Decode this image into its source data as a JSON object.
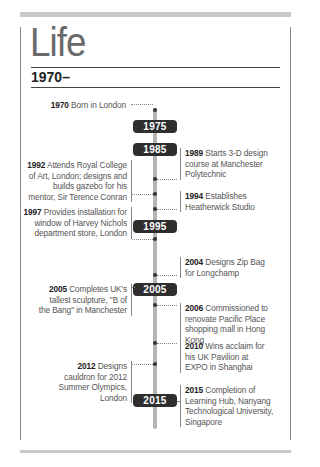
{
  "page": {
    "title": "Life",
    "era": "1970–"
  },
  "colors": {
    "pill_bg": "#2e2e2e",
    "timeline_line": "#b4b4b4",
    "border": "#888888",
    "top_bar": "#c9c9c9"
  },
  "timeline": {
    "decades": [
      "1975",
      "1985",
      "1995",
      "2005",
      "2015"
    ],
    "events": [
      {
        "year": "1970",
        "text": "Born in London",
        "side": "left"
      },
      {
        "year": "1989",
        "text": "Starts 3-D design course at Manchester Polytechnic",
        "side": "right"
      },
      {
        "year": "1992",
        "text": "Attends Royal College of Art, London; designs and builds gazebo for his mentor, Sir Terence Conran",
        "side": "left"
      },
      {
        "year": "1994",
        "text": "Establishes Heatherwick Studio",
        "side": "right"
      },
      {
        "year": "1997",
        "text": "Provides installation for window of Harvey Nichols department store, London",
        "side": "left"
      },
      {
        "year": "2004",
        "text": "Designs Zip Bag for Longchamp",
        "side": "right"
      },
      {
        "year": "2005",
        "text": "Completes UK's tallest sculpture, \"B of the Bang\" in Manchester",
        "side": "left"
      },
      {
        "year": "2006",
        "text": "Commissioned to renovate Pacific Place shopping mall in Hong Kong",
        "side": "right"
      },
      {
        "year": "2010",
        "text": "Wins acclaim for his UK Pavilion at EXPO in Shanghai",
        "side": "right"
      },
      {
        "year": "2012",
        "text": "Designs cauldron for 2012 Summer Olympics, London",
        "side": "left"
      },
      {
        "year": "2015",
        "text": "Completion of Learning Hub, Nanyang Technological University, Singapore",
        "side": "right"
      }
    ]
  }
}
